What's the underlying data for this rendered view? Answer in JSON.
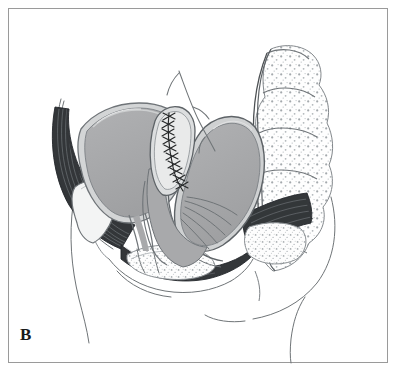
{
  "figure": {
    "panel_label": "B",
    "caption_visible": "",
    "view": "midsagittal-section-female-pelvis",
    "style": "line-drawing-with-gray-tones"
  },
  "colors": {
    "background": "#ffffff",
    "frame_border": "#9a9a9a",
    "outline_dark": "#2b2b2b",
    "outline_mid": "#55585a",
    "outline_light": "#9aa0a3",
    "organ_fill_gray": "#a8a9ab",
    "organ_wall_light": "#cfd1d2",
    "muscle_dark": "#303234",
    "bone_stipple": "#8d9295",
    "bone_fill": "#fbfbfb",
    "cavity_light": "#eef0f1",
    "suture_thread": "#262829",
    "label_text": "#1a1a1a"
  },
  "structures": [
    {
      "id": "bladder",
      "name": "Bladder",
      "side": "anterior-left",
      "fill": "#a8a9ab"
    },
    {
      "id": "bladder-wall",
      "name": "Bladder wall",
      "side": "anterior-left",
      "fill": "#cfd1d2"
    },
    {
      "id": "uterus-cervix-stump",
      "name": "Uterine cervix stump with suture line",
      "side": "central",
      "fill": "#d8dadb"
    },
    {
      "id": "suture-line",
      "name": "Suture line",
      "side": "central",
      "stitch_count": 13
    },
    {
      "id": "vagina",
      "name": "Vaginal canal",
      "side": "central",
      "fill": "#cfd1d2"
    },
    {
      "id": "rectum",
      "name": "Rectum",
      "side": "posterior-right",
      "fill": "#a8a9ab"
    },
    {
      "id": "sacrum",
      "name": "Sacrum and coccyx",
      "side": "posterior",
      "fill": "#fbfbfb"
    },
    {
      "id": "pubic-symphysis",
      "name": "Pubic symphysis",
      "side": "anterior",
      "fill": "#f2f3f3"
    },
    {
      "id": "levator-ani",
      "name": "Levator ani / pelvic floor muscle",
      "side": "inferior",
      "fill": "#303234"
    },
    {
      "id": "peritoneal-fold",
      "name": "Peritoneal fold",
      "side": "superior-central",
      "fill": "none"
    },
    {
      "id": "abdominal-wall-contour",
      "name": "Anterior abdominal wall contour",
      "side": "anterior",
      "fill": "none"
    },
    {
      "id": "gluteal-contour",
      "name": "Gluteal / buttock contour",
      "side": "posterior",
      "fill": "none"
    }
  ]
}
